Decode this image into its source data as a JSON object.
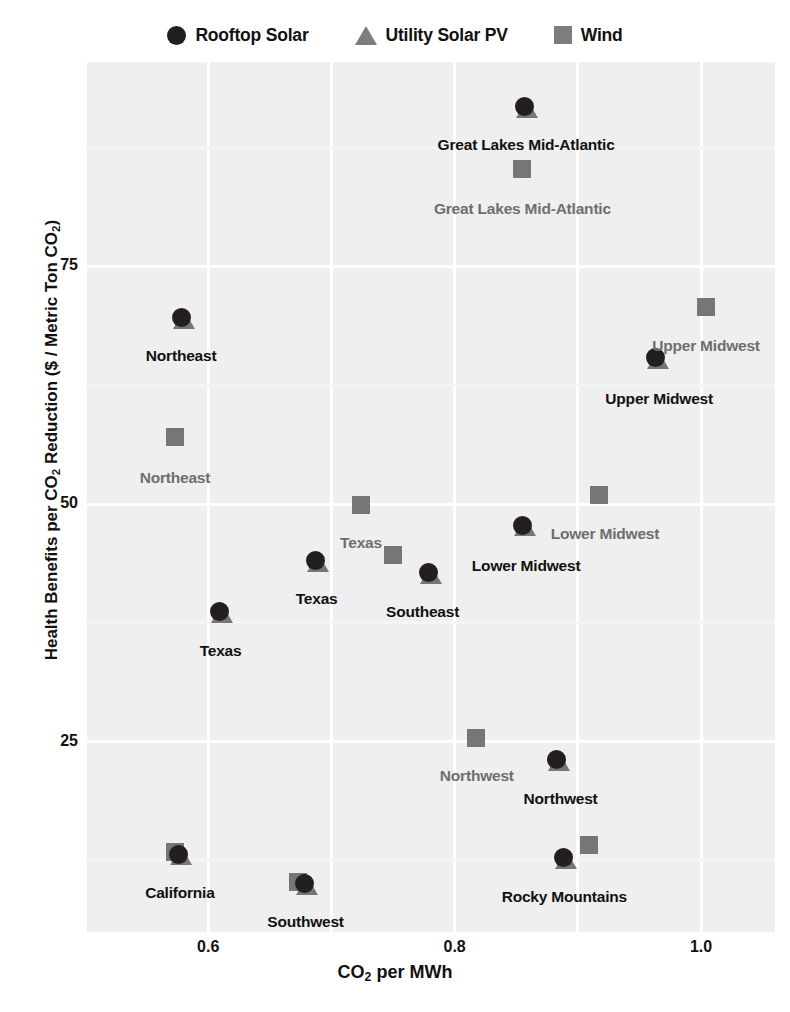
{
  "legend": {
    "items": [
      {
        "label": "Rooftop Solar",
        "marker": "circle-marker",
        "color": "#231f20"
      },
      {
        "label": "Utility Solar PV",
        "marker": "triangle-marker",
        "color": "#7d7d7d"
      },
      {
        "label": "Wind",
        "marker": "square-marker",
        "color": "#7d7d7d"
      }
    ]
  },
  "chart_data": {
    "type": "scatter",
    "title": "",
    "xlabel": "CO2 per MWh",
    "ylabel": "Health Benefits per CO2 Reduction ($ / Metric Ton CO2)",
    "xlim": [
      0.5,
      1.06
    ],
    "ylim": [
      5.0,
      96.5
    ],
    "xticks": [
      0.6,
      0.8,
      1.0
    ],
    "xtick_labels": [
      "0.6",
      "0.8",
      "1.0"
    ],
    "yticks": [
      25,
      50,
      75
    ],
    "ytick_labels": [
      "25",
      "50",
      "75"
    ],
    "grid": true,
    "grid_color": "#ffffff",
    "plot_background": "#efefef",
    "legend_position": "top-center",
    "series": [
      {
        "name": "Rooftop Solar",
        "marker": "circle",
        "color": "#231f20",
        "points": [
          {
            "region": "Great Lakes Mid-Atlantic",
            "x": 0.857,
            "y": 91.8
          },
          {
            "region": "Northeast",
            "x": 0.578,
            "y": 69.6
          },
          {
            "region": "Upper Midwest",
            "x": 0.963,
            "y": 65.4
          },
          {
            "region": "Lower Midwest",
            "x": 0.855,
            "y": 47.8
          },
          {
            "region": "Texas",
            "x": 0.687,
            "y": 44.1
          },
          {
            "region": "Southeast",
            "x": 0.779,
            "y": 42.8
          },
          {
            "region": "Texas",
            "x": 0.609,
            "y": 38.7
          },
          {
            "region": "Northwest",
            "x": 0.883,
            "y": 23.1
          },
          {
            "region": "Rocky Mountains",
            "x": 0.888,
            "y": 12.8
          },
          {
            "region": "California",
            "x": 0.576,
            "y": 13.2
          },
          {
            "region": "Southwest",
            "x": 0.678,
            "y": 10.1
          }
        ]
      },
      {
        "name": "Utility Solar PV",
        "marker": "triangle",
        "color": "#767676",
        "points": [
          {
            "region": "Great Lakes Mid-Atlantic",
            "x": 0.859,
            "y": 91.6
          },
          {
            "region": "Northeast",
            "x": 0.58,
            "y": 69.4
          },
          {
            "region": "Upper Midwest",
            "x": 0.965,
            "y": 65.2
          },
          {
            "region": "Lower Midwest",
            "x": 0.857,
            "y": 47.6
          },
          {
            "region": "Texas",
            "x": 0.689,
            "y": 43.9
          },
          {
            "region": "Southeast",
            "x": 0.781,
            "y": 42.6
          },
          {
            "region": "Texas",
            "x": 0.611,
            "y": 38.5
          },
          {
            "region": "Northwest",
            "x": 0.885,
            "y": 22.9
          },
          {
            "region": "Rocky Mountains",
            "x": 0.89,
            "y": 12.6
          },
          {
            "region": "California",
            "x": 0.578,
            "y": 13.0
          },
          {
            "region": "Southwest",
            "x": 0.68,
            "y": 9.9
          }
        ]
      },
      {
        "name": "Wind",
        "marker": "square",
        "color": "#767676",
        "points": [
          {
            "region": "Great Lakes Mid-Atlantic",
            "x": 0.855,
            "y": 85.2
          },
          {
            "region": "Upper Midwest",
            "x": 1.004,
            "y": 70.7
          },
          {
            "region": "Northeast",
            "x": 0.573,
            "y": 57.1
          },
          {
            "region": "Lower Midwest",
            "x": 0.917,
            "y": 51.0
          },
          {
            "region": "Texas",
            "x": 0.724,
            "y": 49.9
          },
          {
            "region": "Southeast",
            "x": 0.75,
            "y": 44.6
          },
          {
            "region": "Northwest",
            "x": 0.817,
            "y": 25.4
          },
          {
            "region": "Rocky Mountains",
            "x": 0.909,
            "y": 14.2
          },
          {
            "region": "California",
            "x": 0.573,
            "y": 13.4
          },
          {
            "region": "Southwest",
            "x": 0.673,
            "y": 10.3
          }
        ]
      }
    ],
    "point_labels": [
      {
        "text": "Great Lakes Mid-Atlantic",
        "x": 0.858,
        "y": 87.8,
        "style": "dark"
      },
      {
        "text": "Great Lakes Mid-Atlantic",
        "x": 0.855,
        "y": 81.0,
        "style": "gray"
      },
      {
        "text": "Upper Midwest",
        "x": 1.004,
        "y": 66.6,
        "style": "gray"
      },
      {
        "text": "Northeast",
        "x": 0.578,
        "y": 65.6,
        "style": "dark"
      },
      {
        "text": "Upper Midwest",
        "x": 0.966,
        "y": 61.1,
        "style": "dark"
      },
      {
        "text": "Northeast",
        "x": 0.573,
        "y": 52.8,
        "style": "gray"
      },
      {
        "text": "Lower Midwest",
        "x": 0.922,
        "y": 46.9,
        "style": "gray"
      },
      {
        "text": "Texas",
        "x": 0.724,
        "y": 45.9,
        "style": "gray"
      },
      {
        "text": "Lower Midwest",
        "x": 0.858,
        "y": 43.5,
        "style": "dark"
      },
      {
        "text": "Texas",
        "x": 0.688,
        "y": 40.0,
        "style": "dark"
      },
      {
        "text": "Southeast",
        "x": 0.774,
        "y": 38.7,
        "style": "dark"
      },
      {
        "text": "Texas",
        "x": 0.61,
        "y": 34.6,
        "style": "dark"
      },
      {
        "text": "Northwest",
        "x": 0.818,
        "y": 21.4,
        "style": "gray"
      },
      {
        "text": "Northwest",
        "x": 0.886,
        "y": 19.0,
        "style": "dark"
      },
      {
        "text": "California",
        "x": 0.577,
        "y": 9.1,
        "style": "dark"
      },
      {
        "text": "Rocky Mountains",
        "x": 0.889,
        "y": 8.7,
        "style": "dark"
      },
      {
        "text": "Southwest",
        "x": 0.679,
        "y": 6.0,
        "style": "dark"
      }
    ]
  }
}
